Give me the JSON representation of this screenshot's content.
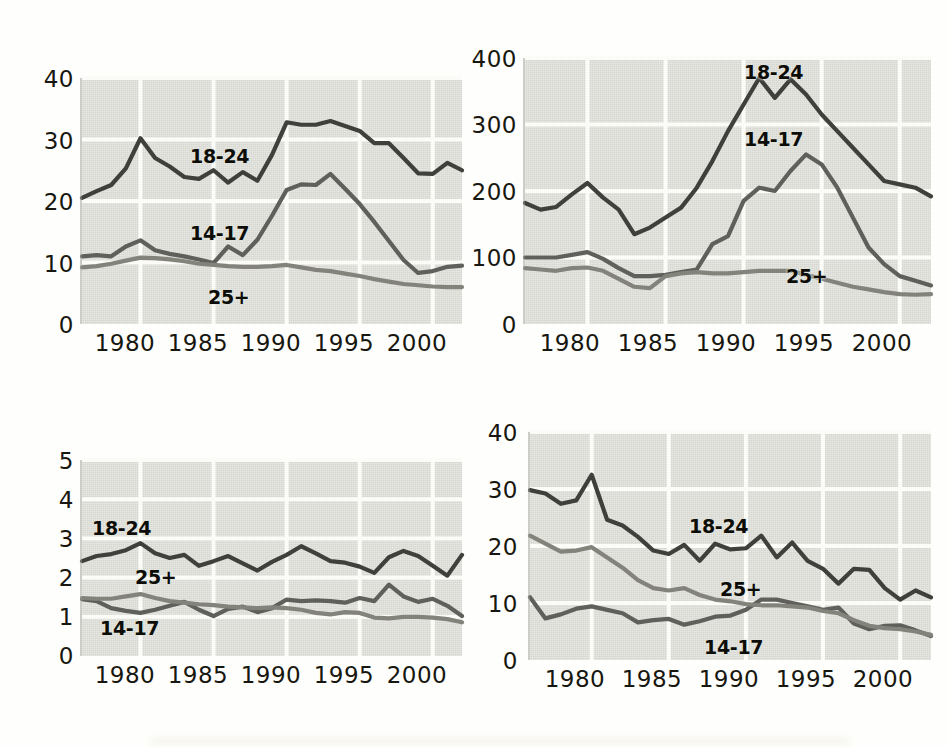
{
  "figure": {
    "title": "",
    "background_color": "#fefefd",
    "plot_background_color": "#d6d7d0",
    "grid_color": "#fbfbf7",
    "series_colors": {
      "18-24": "#3f3f3c",
      "14-17": "#5f5f5b",
      "25+": "#83837c"
    }
  },
  "panels": [
    {
      "id": "top-left",
      "ylim": [
        0,
        40
      ],
      "yticks": [
        "0",
        "10",
        "20",
        "30",
        "40"
      ],
      "ytick_values": [
        0,
        10,
        20,
        30,
        40
      ],
      "xlim": [
        1976,
        2002
      ],
      "xticks": [
        "1980",
        "1985",
        "1990",
        "1995",
        "2000"
      ],
      "xtick_values": [
        1980,
        1985,
        1990,
        1995,
        2000
      ],
      "labels": [
        {
          "text": "18-24",
          "x": 1984.0,
          "y": 28.2
        },
        {
          "text": "14-17",
          "x": 1984.0,
          "y": 18.0
        },
        {
          "text": "25+",
          "x": 1985.3,
          "y": 4.8
        }
      ]
    },
    {
      "id": "top-right",
      "ylim": [
        0,
        400
      ],
      "yticks": [
        "0",
        "100",
        "200",
        "300",
        "400"
      ],
      "ytick_values": [
        0,
        100,
        200,
        300,
        400
      ],
      "xlim": [
        1976,
        2002
      ],
      "xticks": [
        "1980",
        "1985",
        "1990",
        "1995",
        "2000"
      ],
      "xtick_values": [
        1980,
        1985,
        1990,
        1995,
        2000
      ],
      "labels": [
        {
          "text": "18-24",
          "x": 1991.6,
          "y": 388
        },
        {
          "text": "14-17",
          "x": 1991.6,
          "y": 288
        },
        {
          "text": "25+",
          "x": 1994.3,
          "y": 88
        }
      ]
    },
    {
      "id": "bottom-left",
      "ylim": [
        0,
        5
      ],
      "yticks": [
        "0",
        "1",
        "2",
        "3",
        "4",
        "5"
      ],
      "ytick_values": [
        0,
        1,
        2,
        3,
        4,
        5
      ],
      "xlim": [
        1976,
        2002
      ],
      "xticks": [
        "1980",
        "1985",
        "1990",
        "1995",
        "2000"
      ],
      "xtick_values": [
        1980,
        1985,
        1990,
        1995,
        2000
      ],
      "labels": [
        {
          "text": "18-24",
          "x": 1977.6,
          "y": 3.3
        },
        {
          "text": "25+",
          "x": 1980.4,
          "y": 2.07
        },
        {
          "text": "14-17",
          "x": 1978.2,
          "y": 0.76
        }
      ]
    },
    {
      "id": "bottom-right",
      "ylim": [
        0,
        40
      ],
      "yticks": [
        "0",
        "10",
        "20",
        "30",
        "40"
      ],
      "ytick_values": [
        0,
        10,
        20,
        30,
        40
      ],
      "xlim": [
        1976,
        2002
      ],
      "xticks": [
        "1980",
        "1985",
        "1990",
        "1995",
        "2000"
      ],
      "xtick_values": [
        1980,
        1985,
        1990,
        1995,
        2000
      ],
      "labels": [
        {
          "text": "18-24",
          "x": 1986.6,
          "y": 24.5
        },
        {
          "text": "25+",
          "x": 1988.6,
          "y": 13.6
        },
        {
          "text": "14-17",
          "x": 1987.6,
          "y": 3.2
        }
      ]
    }
  ],
  "chart_data": [
    {
      "type": "line",
      "id": "top-left",
      "title": "",
      "xlabel": "",
      "ylabel": "",
      "xlim": [
        1976,
        2002
      ],
      "ylim": [
        0,
        40
      ],
      "grid": true,
      "legend": "inline-labels",
      "x": [
        1976,
        1977,
        1978,
        1979,
        1980,
        1981,
        1982,
        1983,
        1984,
        1985,
        1986,
        1987,
        1988,
        1989,
        1990,
        1991,
        1992,
        1993,
        1994,
        1995,
        1996,
        1997,
        1998,
        1999,
        2000,
        2001,
        2002
      ],
      "series": [
        {
          "name": "18-24",
          "color": "#3f3f3c",
          "values": [
            20.5,
            21.6,
            22.6,
            25.3,
            30.2,
            27.0,
            25.6,
            23.9,
            23.6,
            25.0,
            23.0,
            24.7,
            23.3,
            27.5,
            32.8,
            32.4,
            32.4,
            33.0,
            32.2,
            31.4,
            29.4,
            29.4,
            27.0,
            24.5,
            24.4,
            26.2,
            25.0
          ]
        },
        {
          "name": "14-17",
          "color": "#5f5f5b",
          "values": [
            11.0,
            11.2,
            11.0,
            12.6,
            13.6,
            12.0,
            11.4,
            11.0,
            10.5,
            9.9,
            12.6,
            11.2,
            13.7,
            17.6,
            21.8,
            22.7,
            22.6,
            24.4,
            22.0,
            19.5,
            16.6,
            13.5,
            10.4,
            8.3,
            8.6,
            9.3,
            9.5
          ]
        },
        {
          "name": "25+",
          "color": "#83837c",
          "values": [
            9.2,
            9.4,
            9.8,
            10.3,
            10.8,
            10.7,
            10.5,
            10.2,
            9.8,
            9.6,
            9.4,
            9.3,
            9.3,
            9.4,
            9.6,
            9.2,
            8.8,
            8.6,
            8.2,
            7.8,
            7.3,
            6.9,
            6.5,
            6.3,
            6.1,
            6.0,
            6.0
          ]
        }
      ]
    },
    {
      "type": "line",
      "id": "top-right",
      "title": "",
      "xlabel": "",
      "ylabel": "",
      "xlim": [
        1976,
        2002
      ],
      "ylim": [
        0,
        400
      ],
      "grid": true,
      "legend": "inline-labels",
      "x": [
        1976,
        1977,
        1978,
        1979,
        1980,
        1981,
        1982,
        1983,
        1984,
        1985,
        1986,
        1987,
        1988,
        1989,
        1990,
        1991,
        1992,
        1993,
        1994,
        1995,
        1996,
        1997,
        1998,
        1999,
        2000,
        2001,
        2002
      ],
      "series": [
        {
          "name": "18-24",
          "color": "#3f3f3c",
          "values": [
            182,
            172,
            176,
            195,
            212,
            190,
            172,
            135,
            145,
            160,
            175,
            205,
            245,
            290,
            330,
            370,
            340,
            368,
            345,
            315,
            290,
            265,
            240,
            215,
            210,
            205,
            192
          ]
        },
        {
          "name": "14-17",
          "color": "#5f5f5b",
          "values": [
            100,
            100,
            100,
            104,
            108,
            98,
            84,
            72,
            72,
            74,
            78,
            82,
            120,
            132,
            185,
            205,
            200,
            230,
            255,
            240,
            205,
            160,
            115,
            90,
            72,
            65,
            58
          ]
        },
        {
          "name": "25+",
          "color": "#83837c",
          "values": [
            84,
            82,
            80,
            84,
            85,
            80,
            68,
            56,
            54,
            72,
            76,
            78,
            76,
            76,
            78,
            80,
            80,
            80,
            74,
            68,
            62,
            56,
            52,
            48,
            45,
            44,
            45
          ]
        }
      ]
    },
    {
      "type": "line",
      "id": "bottom-left",
      "title": "",
      "xlabel": "",
      "ylabel": "",
      "xlim": [
        1976,
        2002
      ],
      "ylim": [
        0,
        5
      ],
      "grid": true,
      "legend": "inline-labels",
      "x": [
        1976,
        1977,
        1978,
        1979,
        1980,
        1981,
        1982,
        1983,
        1984,
        1985,
        1986,
        1987,
        1988,
        1989,
        1990,
        1991,
        1992,
        1993,
        1994,
        1995,
        1996,
        1997,
        1998,
        1999,
        2000,
        2001,
        2002
      ],
      "series": [
        {
          "name": "18-24",
          "color": "#3f3f3c",
          "values": [
            2.42,
            2.55,
            2.6,
            2.7,
            2.88,
            2.62,
            2.5,
            2.58,
            2.3,
            2.42,
            2.55,
            2.36,
            2.18,
            2.4,
            2.58,
            2.8,
            2.62,
            2.42,
            2.38,
            2.28,
            2.12,
            2.52,
            2.68,
            2.55,
            2.3,
            2.05,
            2.58
          ]
        },
        {
          "name": "14-17",
          "color": "#5f5f5b",
          "values": [
            1.45,
            1.4,
            1.22,
            1.15,
            1.1,
            1.18,
            1.28,
            1.38,
            1.18,
            1.02,
            1.2,
            1.26,
            1.12,
            1.22,
            1.44,
            1.4,
            1.42,
            1.4,
            1.36,
            1.48,
            1.4,
            1.82,
            1.52,
            1.38,
            1.46,
            1.28,
            1.02
          ]
        },
        {
          "name": "25+",
          "color": "#83837c",
          "values": [
            1.48,
            1.46,
            1.46,
            1.52,
            1.58,
            1.48,
            1.4,
            1.36,
            1.32,
            1.3,
            1.26,
            1.24,
            1.22,
            1.24,
            1.22,
            1.18,
            1.1,
            1.06,
            1.12,
            1.1,
            0.98,
            0.96,
            1.0,
            1.0,
            0.98,
            0.94,
            0.86
          ]
        }
      ]
    },
    {
      "type": "line",
      "id": "bottom-right",
      "title": "",
      "xlabel": "",
      "ylabel": "",
      "xlim": [
        1976,
        2002
      ],
      "ylim": [
        0,
        40
      ],
      "grid": true,
      "legend": "inline-labels",
      "x": [
        1976,
        1977,
        1978,
        1979,
        1980,
        1981,
        1982,
        1983,
        1984,
        1985,
        1986,
        1987,
        1988,
        1989,
        1990,
        1991,
        1992,
        1993,
        1994,
        1995,
        1996,
        1997,
        1998,
        1999,
        2000,
        2001,
        2002
      ],
      "series": [
        {
          "name": "18-24",
          "color": "#3f3f3c",
          "values": [
            29.8,
            29.2,
            27.4,
            28.0,
            32.5,
            24.6,
            23.6,
            21.6,
            19.2,
            18.6,
            20.2,
            17.4,
            20.4,
            19.4,
            19.6,
            21.8,
            18.0,
            20.6,
            17.4,
            16.0,
            13.4,
            16.0,
            15.8,
            12.6,
            10.6,
            12.2,
            11.0
          ]
        },
        {
          "name": "14-17",
          "color": "#5f5f5b",
          "values": [
            11.0,
            7.3,
            8.0,
            9.0,
            9.4,
            8.8,
            8.2,
            6.6,
            7.0,
            7.2,
            6.2,
            6.8,
            7.6,
            7.8,
            8.8,
            10.6,
            10.6,
            10.0,
            9.4,
            8.8,
            9.2,
            6.4,
            5.4,
            6.0,
            6.1,
            5.2,
            4.2
          ]
        },
        {
          "name": "25+",
          "color": "#83837c",
          "values": [
            21.8,
            20.4,
            19.0,
            19.2,
            19.8,
            18.0,
            16.2,
            14.0,
            12.6,
            12.2,
            12.6,
            11.4,
            10.6,
            10.3,
            9.8,
            9.6,
            9.6,
            9.4,
            9.2,
            8.6,
            8.2,
            7.0,
            6.0,
            5.6,
            5.4,
            5.0,
            4.4
          ]
        }
      ]
    }
  ]
}
